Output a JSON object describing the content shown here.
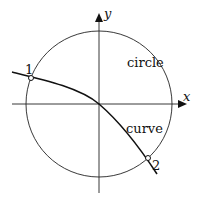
{
  "diagram": {
    "axes": {
      "x_label": "x",
      "y_label": "y"
    },
    "labels": {
      "circle": "circle",
      "curve": "curve",
      "point1": "1",
      "point2": "2"
    },
    "colors": {
      "stroke": "#111111",
      "background": "#ffffff"
    }
  }
}
